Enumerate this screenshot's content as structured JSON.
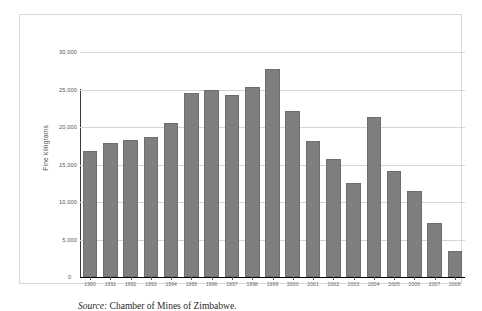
{
  "chart_data": {
    "type": "bar",
    "title": "",
    "xlabel": "",
    "ylabel": "Fine kilograms",
    "ylim": [
      0,
      30000
    ],
    "grid": true,
    "legend": "none",
    "categories": [
      "1990",
      "1991",
      "1992",
      "1993",
      "1994",
      "1995",
      "1996",
      "1997",
      "1998",
      "1999",
      "2000",
      "2001",
      "2002",
      "2003",
      "2004",
      "2005",
      "2006",
      "2007",
      "2008"
    ],
    "values": [
      16800,
      17900,
      18300,
      18700,
      20600,
      24600,
      25000,
      24300,
      25300,
      27800,
      22200,
      18200,
      15700,
      12500,
      21400,
      14200,
      11500,
      7200,
      3500
    ],
    "y_ticks": [
      0,
      5000,
      10000,
      15000,
      20000,
      25000,
      30000
    ],
    "y_tick_labels": [
      "0",
      "5,000",
      "10,000",
      "15,000",
      "20,000",
      "25,000",
      "30,000"
    ],
    "series_name": "Gold output",
    "bar_color": "#7f7f7f",
    "bar_border_color": "#6e6e6e",
    "gridline_color": "#d5d5d5",
    "axis_color": "#3a3a3a"
  },
  "caption": {
    "source_word": "Source:",
    "source_text": "Chamber of Mines of Zimbabwe."
  }
}
